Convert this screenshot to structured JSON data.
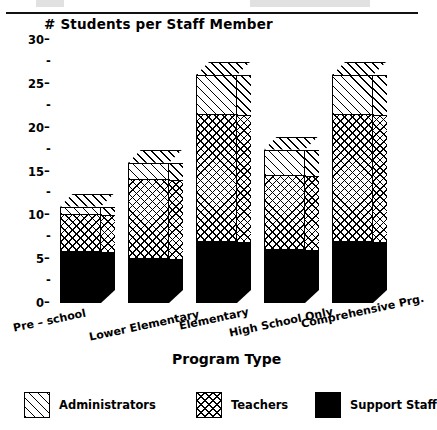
{
  "chart_data": {
    "type": "bar",
    "subtype": "stacked-bar-3d",
    "title": "# Students per Staff Member",
    "xlabel": "Program Type",
    "ylabel": "# Students per Staff Member",
    "ylim": [
      0,
      30
    ],
    "ytick_step": 5,
    "yminor_step": 2.5,
    "grid": false,
    "legend_position": "bottom",
    "categories": [
      "Pre – school",
      "Lower Elementary",
      "Elementary",
      "High School Only",
      "Comprehensive Prg."
    ],
    "yticks": [
      "30",
      "25",
      "20",
      "15",
      "10",
      "5",
      "0"
    ],
    "series": [
      {
        "name": "Support Staff",
        "fill": "solid",
        "values": [
          5.8,
          5.0,
          7.0,
          6.0,
          7.0
        ]
      },
      {
        "name": "Teachers",
        "fill": "cross-hatch",
        "values": [
          4.2,
          9.0,
          14.5,
          8.5,
          14.5
        ]
      },
      {
        "name": "Administrators",
        "fill": "diagonal",
        "values": [
          1.0,
          2.0,
          4.5,
          3.0,
          4.5
        ]
      }
    ],
    "totals": [
      11.0,
      16.0,
      26.0,
      17.5,
      26.0
    ],
    "legend": [
      {
        "label": "Administrators",
        "fill": "diagonal"
      },
      {
        "label": "Teachers",
        "fill": "cross-hatch"
      },
      {
        "label": "Support Staff",
        "fill": "solid"
      }
    ],
    "colors": {
      "ink": "#000000",
      "paper": "#ffffff"
    }
  }
}
